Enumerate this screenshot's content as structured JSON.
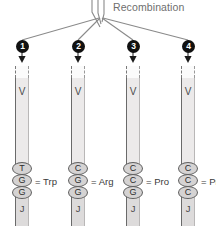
{
  "diagram": {
    "title": "Recombination",
    "segment_v_label": "V",
    "segment_j_label": "J",
    "equals_sign": "=",
    "colors": {
      "badge_fill": "#111111",
      "badge_text": "#ffffff",
      "bar_fill": "#eceaea",
      "bar_border": "#6a6a6a",
      "nucleotide_fill": "#d5d3d3",
      "nucleotide_border": "#5f5f5f",
      "label_text": "#6e6e6e",
      "line_stroke": "#8a8a8a"
    },
    "branches": [
      {
        "number": "1",
        "v_label": "V",
        "j_label": "J",
        "codon": [
          "T",
          "G",
          "G"
        ],
        "amino_acid": "Trp",
        "equation": "= Trp"
      },
      {
        "number": "2",
        "v_label": "V",
        "j_label": "J",
        "codon": [
          "C",
          "G",
          "G"
        ],
        "amino_acid": "Arg",
        "equation": "= Arg"
      },
      {
        "number": "3",
        "v_label": "V",
        "j_label": "J",
        "codon": [
          "C",
          "C",
          "G"
        ],
        "amino_acid": "Pro",
        "equation": "= Pro"
      },
      {
        "number": "4",
        "v_label": "V",
        "j_label": "J",
        "codon": [
          "C",
          "C",
          "C"
        ],
        "amino_acid": "Pro",
        "equation": "= Pro"
      }
    ]
  }
}
